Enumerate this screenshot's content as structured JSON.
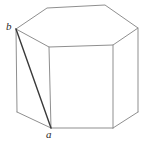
{
  "figure": {
    "type": "geometric-line-drawing",
    "background_color": "#ffffff",
    "stroke_color_light": "#8f8f8f",
    "stroke_color_dark": "#3a3a3a",
    "stroke_width_light": 1,
    "stroke_width_dark": 1.4,
    "canvas": {
      "width": 148,
      "height": 147
    },
    "labels": {
      "b": "b",
      "a": "a"
    },
    "vertices": {
      "top_back_left": [
        16,
        29
      ],
      "top_top_left": [
        47,
        8
      ],
      "top_top_right": [
        105,
        5
      ],
      "top_back_right": [
        138,
        28
      ],
      "top_front_right": [
        113,
        45
      ],
      "top_front_left": [
        49,
        47
      ],
      "bot_back_left": [
        17,
        112
      ],
      "bot_front_left": [
        51,
        128
      ],
      "bot_front_right": [
        113,
        128
      ],
      "bot_back_right": [
        138,
        112
      ]
    },
    "edges": {
      "top_face": "16,29 47,8 105,5 138,28 113,45 49,47 16,29",
      "vertical_left": "16,29 17,112",
      "vertical_front_left": "49,47 51,128",
      "vertical_front_right": "113,45 113,128",
      "vertical_right": "138,28 138,112",
      "bottom_left": "17,112 51,128",
      "bottom_front": "51,128 113,128",
      "bottom_right": "113,128 138,112",
      "diagonal_b_to_a": "16,29 51,128"
    }
  }
}
